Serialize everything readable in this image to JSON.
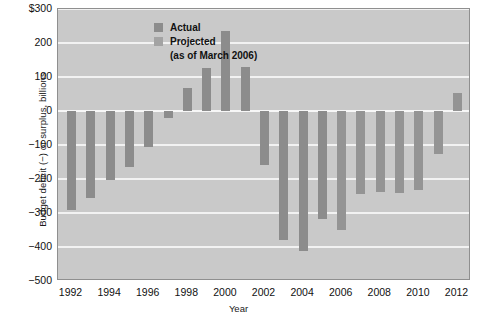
{
  "chart_data": {
    "type": "bar",
    "title": "",
    "xlabel": "Year",
    "ylabel": "Budget deficit (−) or surplus, billions",
    "ylim": [
      -500,
      300
    ],
    "xlim": [
      1991.3,
      2012.7
    ],
    "ytick_labels": [
      "$300",
      "200",
      "100",
      "0",
      "−100",
      "−200",
      "−300",
      "−400",
      "−500"
    ],
    "ytick_values": [
      300,
      200,
      100,
      0,
      -100,
      -200,
      -300,
      -400,
      -500
    ],
    "xtick_labels": [
      "1992",
      "1994",
      "1996",
      "1998",
      "2000",
      "2002",
      "2004",
      "2006",
      "2008",
      "2010",
      "2012"
    ],
    "xtick_values": [
      1992,
      1994,
      1996,
      1998,
      2000,
      2002,
      2004,
      2006,
      2008,
      2010,
      2012
    ],
    "grid": true,
    "legend_position": "top-left",
    "categories": [
      1992,
      1993,
      1994,
      1995,
      1996,
      1997,
      1998,
      1999,
      2000,
      2001,
      2002,
      2003,
      2004,
      2005,
      2006,
      2007,
      2008,
      2009,
      2010,
      2011,
      2012
    ],
    "values": [
      -290,
      -255,
      -203,
      -164,
      -107,
      -22,
      69,
      126,
      236,
      128,
      -158,
      -378,
      -413,
      -318,
      -350,
      -244,
      -239,
      -241,
      -233,
      -126,
      54
    ],
    "series_kind": [
      "actual",
      "actual",
      "actual",
      "actual",
      "actual",
      "actual",
      "actual",
      "actual",
      "actual",
      "actual",
      "actual",
      "actual",
      "actual",
      "actual",
      "projected",
      "projected",
      "projected",
      "projected",
      "projected",
      "projected",
      "projected"
    ],
    "series": [
      {
        "name": "Actual",
        "color": "#8c8c8c"
      },
      {
        "name": "Projected",
        "color": "#a3a3a3"
      }
    ]
  },
  "legend": {
    "actual_label": "Actual",
    "projected_label": "Projected",
    "projected_note": "(as of March 2006)"
  },
  "colors": {
    "plot_background": "#c9c9c9",
    "gridline": "#f2f2f2",
    "bar_actual": "#8c8c8c",
    "bar_projected": "#949494",
    "frame": "#8f8f8f",
    "text": "#111111"
  }
}
